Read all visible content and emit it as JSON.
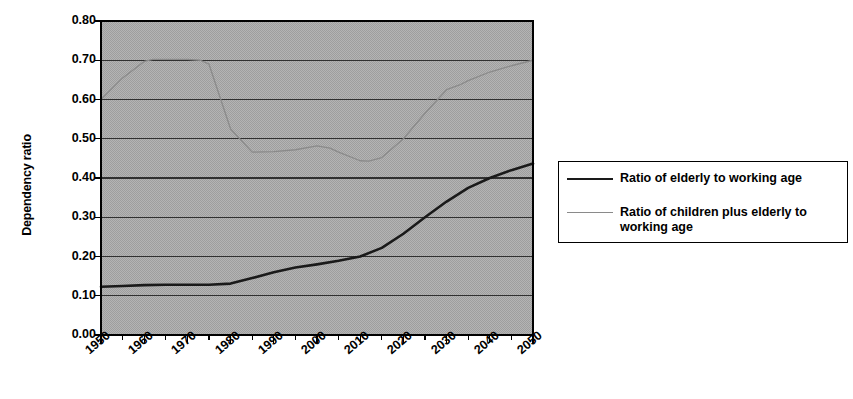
{
  "chart_data": {
    "type": "line",
    "title": "",
    "xlabel": "",
    "ylabel": "Dependency ratio",
    "xlim": [
      1950,
      2050
    ],
    "ylim": [
      0.0,
      0.8
    ],
    "grid": true,
    "legend_position": "right",
    "y_ticks": [
      "0.80",
      "0.70",
      "0.60",
      "0.50",
      "0.40",
      "0.30",
      "0.20",
      "0.10",
      "0.00"
    ],
    "y_tick_values": [
      0.8,
      0.7,
      0.6,
      0.5,
      0.4,
      0.3,
      0.2,
      0.1,
      0.0
    ],
    "x_ticks": [
      "1950",
      "1960",
      "1970",
      "1980",
      "1990",
      "2000",
      "2010",
      "2020",
      "2030",
      "2040",
      "2050"
    ],
    "x_tick_values": [
      1950,
      1960,
      1970,
      1980,
      1990,
      2000,
      2010,
      2020,
      2030,
      2040,
      2050
    ],
    "x_minor_interval": 5,
    "series": [
      {
        "name": "Ratio of elderly to working age",
        "color": "#1a1a1a",
        "width": 2.6,
        "x": [
          1950,
          1955,
          1960,
          1965,
          1970,
          1975,
          1980,
          1985,
          1990,
          1995,
          2000,
          2005,
          2010,
          2015,
          2020,
          2025,
          2030,
          2035,
          2040,
          2045,
          2050
        ],
        "values": [
          0.123,
          0.125,
          0.127,
          0.128,
          0.128,
          0.128,
          0.131,
          0.145,
          0.16,
          0.172,
          0.18,
          0.189,
          0.2,
          0.222,
          0.258,
          0.3,
          0.34,
          0.375,
          0.4,
          0.42,
          0.437
        ]
      },
      {
        "name": "Ratio of children plus elderly to working age",
        "color": "#8a8a8a",
        "width": 1.3,
        "x": [
          1950,
          1955,
          1960,
          1962,
          1965,
          1970,
          1973,
          1975,
          1980,
          1985,
          1990,
          1995,
          2000,
          2003,
          2005,
          2010,
          2012,
          2015,
          2020,
          2025,
          2030,
          2033,
          2035,
          2040,
          2045,
          2050
        ],
        "values": [
          0.6,
          0.655,
          0.697,
          0.702,
          0.702,
          0.702,
          0.7,
          0.69,
          0.525,
          0.466,
          0.467,
          0.472,
          0.482,
          0.476,
          0.466,
          0.444,
          0.443,
          0.452,
          0.5,
          0.565,
          0.625,
          0.637,
          0.648,
          0.67,
          0.686,
          0.7
        ]
      }
    ]
  },
  "axes": {
    "y_title": "Dependency ratio"
  },
  "legend": {
    "entries": [
      {
        "label": "Ratio of elderly to working age",
        "swatch": "dark-line-swatch"
      },
      {
        "label": "Ratio of children plus elderly to working age",
        "swatch": "light-line-swatch"
      }
    ]
  },
  "style": {
    "plot_background": "#a9a9a9",
    "gridline_color": "#303030",
    "axis_color": "#000000",
    "elderly_series_color": "#1a1a1a",
    "total_series_color": "#8a8a8a",
    "page_background": "#ffffff"
  }
}
